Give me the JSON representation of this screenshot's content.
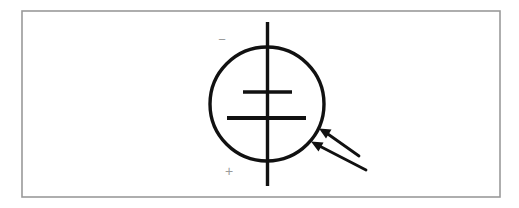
{
  "figure": {
    "title": "Photovoltaic (solar) cell circuit symbol",
    "description": "A battery cell symbol enclosed in a circle with two parallel arrows pointing at the circle, denoting incident light.",
    "canvas": {
      "width": 519,
      "height": 208,
      "background_color": "#ffffff"
    },
    "frame": {
      "name": "outer-border",
      "x": 22,
      "y": 11,
      "width": 478,
      "height": 186,
      "stroke_color": "#9a9a9a",
      "stroke_width": 1.6,
      "fill_color": "#ffffff"
    },
    "circle": {
      "name": "cell-body-circle",
      "cx": 267,
      "cy": 104,
      "r": 57,
      "stroke_color": "#111111",
      "stroke_width": 3.4,
      "fill_color": "none"
    },
    "lead_line": {
      "name": "vertical-lead-line",
      "x": 267.5,
      "y1": 22,
      "y2": 186,
      "stroke_color": "#111111",
      "stroke_width": 3.4
    },
    "plates": [
      {
        "name": "short-plate-negative",
        "x1": 243,
        "x2": 292,
        "y": 92,
        "stroke_color": "#111111",
        "stroke_width": 3.6,
        "role": "short plate"
      },
      {
        "name": "long-plate-positive",
        "x1": 227,
        "x2": 306,
        "y": 118,
        "stroke_color": "#111111",
        "stroke_width": 4.2,
        "role": "long plate"
      }
    ],
    "light_arrows": [
      {
        "name": "light-arrow-upper",
        "tail_x": 359,
        "tail_y": 156,
        "tip_x": 320,
        "tip_y": 129,
        "stroke_color": "#111111",
        "stroke_width": 2.8,
        "direction": "up-left toward cell"
      },
      {
        "name": "light-arrow-lower",
        "tail_x": 366,
        "tail_y": 170,
        "tip_x": 312,
        "tip_y": 142,
        "stroke_color": "#111111",
        "stroke_width": 2.8,
        "direction": "up-left toward cell"
      }
    ],
    "polarity_marks": [
      {
        "name": "negative-polarity-mark",
        "symbol": "−",
        "x": 222,
        "y": 40,
        "color": "#9b9b9b",
        "font_size": 13,
        "terminal": "negative"
      },
      {
        "name": "positive-polarity-mark",
        "symbol": "+",
        "x": 229,
        "y": 171,
        "color": "#9b9b9b",
        "font_size": 13,
        "terminal": "positive"
      }
    ]
  }
}
